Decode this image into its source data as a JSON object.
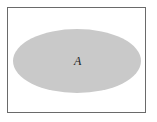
{
  "diagram": {
    "type": "venn",
    "universe": {
      "stroke": "#6a6a6a",
      "fill": "#ffffff"
    },
    "sets": [
      {
        "label": "A",
        "fill": "#c8c8c8"
      }
    ]
  }
}
